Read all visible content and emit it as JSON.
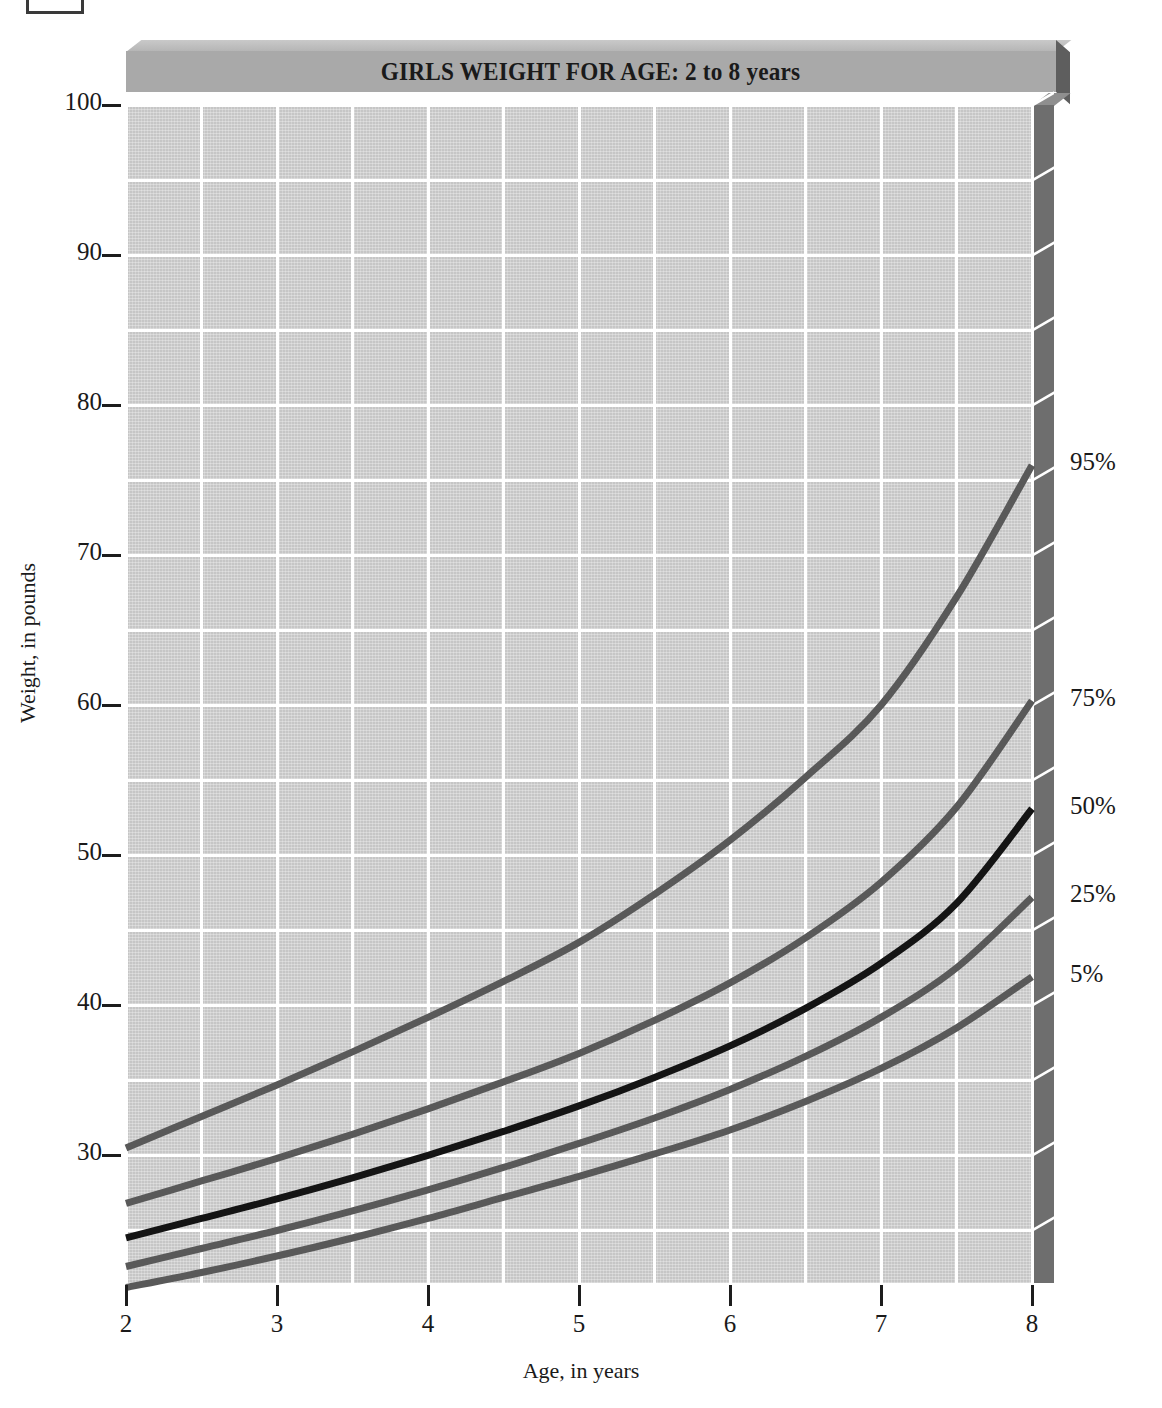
{
  "figure": {
    "title": "GIRLS WEIGHT FOR AGE: 2 to 8 years",
    "xaxis_title": "Age, in years",
    "yaxis_title": "Weight, in pounds"
  },
  "colors": {
    "plot_background": "#c6c6c6",
    "gridline": "#ffffff",
    "title_bar_face": "#a9a9a9",
    "title_bar_side": "#5e5e5e",
    "plot_right_wall": "#6e6e6e",
    "curve_outer": "#595959",
    "curve_median": "#141414",
    "text": "#1a1a1a"
  },
  "chart_data": {
    "type": "line",
    "title": "GIRLS WEIGHT FOR AGE: 2 to 8 years",
    "xlabel": "Age, in years",
    "ylabel": "Weight, in pounds",
    "xlim": [
      2,
      8
    ],
    "ylim": [
      21.5,
      100
    ],
    "grid": true,
    "legend_position": "right-inline",
    "x_major_ticks": [
      2,
      3,
      4,
      5,
      6,
      7,
      8
    ],
    "x_tick_labels": [
      "2",
      "3",
      "4",
      "5",
      "6",
      "7",
      "8"
    ],
    "x_minor_step": 0.5,
    "y_major_ticks": [
      30,
      40,
      50,
      60,
      70,
      80,
      90,
      100
    ],
    "y_tick_labels": [
      "30",
      "40",
      "50",
      "60",
      "70",
      "80",
      "90",
      "100"
    ],
    "y_minor_step": 5,
    "x": [
      2,
      2.5,
      3,
      3.5,
      4,
      4.5,
      5,
      5.5,
      6,
      6.5,
      7,
      7.5,
      8
    ],
    "series": [
      {
        "name": "95%",
        "label": "95%",
        "color": "#595959",
        "width": 7,
        "values": [
          30.5,
          32.6,
          34.7,
          36.9,
          39.2,
          41.6,
          44.2,
          47.4,
          51.0,
          55.2,
          60.0,
          67.2,
          76.0
        ]
      },
      {
        "name": "75%",
        "label": "75%",
        "color": "#595959",
        "width": 7,
        "values": [
          26.8,
          28.3,
          29.8,
          31.4,
          33.1,
          34.9,
          36.8,
          39.0,
          41.5,
          44.5,
          48.2,
          53.2,
          60.3
        ]
      },
      {
        "name": "50%",
        "label": "50%",
        "color": "#141414",
        "width": 7,
        "values": [
          24.5,
          25.8,
          27.1,
          28.5,
          30.0,
          31.6,
          33.3,
          35.2,
          37.3,
          39.8,
          42.8,
          46.8,
          53.1
        ]
      },
      {
        "name": "25%",
        "label": "25%",
        "color": "#595959",
        "width": 7,
        "values": [
          22.6,
          23.8,
          25.0,
          26.3,
          27.7,
          29.2,
          30.8,
          32.5,
          34.4,
          36.6,
          39.2,
          42.5,
          47.2
        ]
      },
      {
        "name": "5%",
        "label": "5%",
        "color": "#595959",
        "width": 7,
        "values": [
          21.2,
          22.2,
          23.3,
          24.5,
          25.8,
          27.2,
          28.6,
          30.1,
          31.7,
          33.6,
          35.8,
          38.5,
          41.9
        ]
      }
    ]
  }
}
